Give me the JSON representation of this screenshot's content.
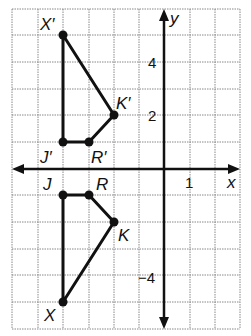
{
  "axes": {
    "x_label": "x",
    "y_label": "y",
    "tick_labels": [
      {
        "text": "4",
        "axis": "y",
        "value": 4
      },
      {
        "text": "2",
        "axis": "y",
        "value": 2
      },
      {
        "text": "1",
        "axis": "x",
        "value": 1
      },
      {
        "text": "−4",
        "axis": "y",
        "value": -4
      }
    ],
    "x_range": [
      -6,
      3
    ],
    "y_range": [
      -6,
      6
    ],
    "grid": true
  },
  "original": {
    "vertices": [
      {
        "label": "J",
        "x": -4,
        "y": -1
      },
      {
        "label": "R",
        "x": -3,
        "y": -1
      },
      {
        "label": "K",
        "x": -2,
        "y": -2
      },
      {
        "label": "X",
        "x": -4,
        "y": -5
      }
    ]
  },
  "image": {
    "vertices": [
      {
        "label": "J′",
        "x": -4,
        "y": 1
      },
      {
        "label": "R′",
        "x": -3,
        "y": 1
      },
      {
        "label": "K′",
        "x": -2,
        "y": 2
      },
      {
        "label": "X′",
        "x": -4,
        "y": 5
      }
    ]
  },
  "labels": {
    "J": "J",
    "R": "R",
    "K": "K",
    "X": "X",
    "Jp": "J′",
    "Rp": "R′",
    "Kp": "K′",
    "Xp": "X′",
    "x_axis": "x",
    "y_axis": "y",
    "tick_4": "4",
    "tick_2": "2",
    "tick_1": "1",
    "tick_neg4": "−4"
  }
}
